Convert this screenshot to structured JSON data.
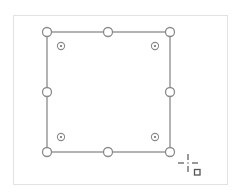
{
  "canvas": {
    "panel": {
      "x": 13,
      "y": 15,
      "width": 215,
      "height": 170,
      "border_color": "#e2e2e2"
    },
    "selected_shape": {
      "type": "rectangle",
      "x": 47,
      "y": 32,
      "width": 123,
      "height": 120,
      "stroke_color": "#8a8a8a",
      "stroke_width": 1.3
    },
    "resize_handles": [
      {
        "name": "top-left",
        "cx": 47,
        "cy": 32
      },
      {
        "name": "top-middle",
        "cx": 108,
        "cy": 32
      },
      {
        "name": "top-right",
        "cx": 170,
        "cy": 32
      },
      {
        "name": "middle-left",
        "cx": 47,
        "cy": 92
      },
      {
        "name": "middle-right",
        "cx": 170,
        "cy": 92
      },
      {
        "name": "bottom-left",
        "cx": 47,
        "cy": 152
      },
      {
        "name": "bottom-middle",
        "cx": 108,
        "cy": 152
      },
      {
        "name": "bottom-right",
        "cx": 170,
        "cy": 152
      }
    ],
    "resize_handle_style": {
      "r": 4.5,
      "fill": "#ffffff",
      "stroke": "#8a8a8a"
    },
    "corner_radius_handles": [
      {
        "name": "top-left",
        "cx": 61,
        "cy": 46
      },
      {
        "name": "top-right",
        "cx": 155,
        "cy": 46
      },
      {
        "name": "bottom-left",
        "cx": 61,
        "cy": 137
      },
      {
        "name": "bottom-right",
        "cx": 155,
        "cy": 137
      }
    ],
    "corner_radius_handle_style": {
      "r": 3.6,
      "dot_r": 1.1,
      "stroke": "#8a8a8a",
      "dot_fill": "#707070"
    },
    "cursor": {
      "icon": "crosshair-rectangle-cursor-icon",
      "cx": 188,
      "cy": 163,
      "color": "#555555"
    }
  }
}
